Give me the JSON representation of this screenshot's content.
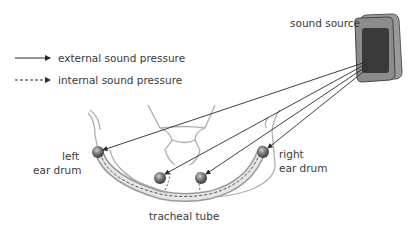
{
  "legend": {
    "external": "external sound pressure",
    "internal": "internal sound pressure"
  },
  "labels": {
    "sound_source": "sound source",
    "left_ear_line1": "left",
    "left_ear_line2": "ear drum",
    "right_ear_line1": "right",
    "right_ear_line2": "ear drum",
    "tracheal_tube": "tracheal tube"
  },
  "colors": {
    "line": "#2a2a2a",
    "outline": "#b0b0b0",
    "speaker_body": "#8c8c8c",
    "speaker_grille": "#3a3a3a"
  }
}
